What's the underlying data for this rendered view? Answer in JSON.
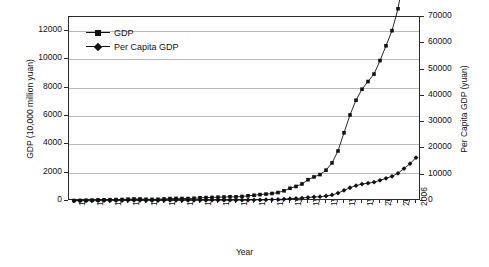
{
  "chart_data": {
    "type": "line",
    "title": "",
    "xlabel": "Year",
    "ylabel": "GDP (10,000 million yuan)",
    "y2label": "Per Capita GDP (yuan)",
    "ylim": [
      0,
      13000
    ],
    "y2lim": [
      0,
      70000
    ],
    "yticks": [
      0,
      2000,
      4000,
      6000,
      8000,
      10000,
      12000
    ],
    "y2ticks": [
      0,
      10000,
      20000,
      30000,
      40000,
      50000,
      60000,
      70000
    ],
    "grid": true,
    "legend_position": "top-left inside plot",
    "xlim": [
      1949,
      2006
    ],
    "xticks": [
      1949,
      1952,
      1955,
      1958,
      1961,
      1964,
      1967,
      1970,
      1973,
      1976,
      1979,
      1982,
      1985,
      1988,
      1991,
      1994,
      1997,
      2000,
      2003,
      2006
    ],
    "x": [
      1949,
      1950,
      1951,
      1952,
      1953,
      1954,
      1955,
      1956,
      1957,
      1958,
      1959,
      1960,
      1961,
      1962,
      1963,
      1964,
      1965,
      1966,
      1967,
      1968,
      1969,
      1970,
      1971,
      1972,
      1973,
      1974,
      1975,
      1976,
      1977,
      1978,
      1979,
      1980,
      1981,
      1982,
      1983,
      1984,
      1985,
      1986,
      1987,
      1988,
      1989,
      1990,
      1991,
      1992,
      1993,
      1994,
      1995,
      1996,
      1997,
      1998,
      1999,
      2000,
      2001,
      2002,
      2003,
      2004,
      2005,
      2006
    ],
    "series": [
      {
        "name": "GDP",
        "marker": "square",
        "axis": "left",
        "units": "10,000 million yuan",
        "values": [
          30,
          40,
          50,
          60,
          80,
          85,
          91,
          103,
          107,
          131,
          144,
          146,
          122,
          114,
          123,
          145,
          172,
          187,
          177,
          172,
          194,
          225,
          242,
          252,
          272,
          279,
          299,
          294,
          321,
          365,
          406,
          452,
          489,
          532,
          596,
          720,
          901,
          1028,
          1205,
          1504,
          1700,
          1866,
          2178,
          2692,
          3533,
          4820,
          6079,
          7118,
          7897,
          8440,
          8968,
          9921,
          10966,
          12033,
          13582,
          15988,
          18494,
          21631
        ]
      },
      {
        "name": "Per Capita GDP",
        "marker": "diamond",
        "axis": "right",
        "units": "yuan",
        "values": [
          70,
          80,
          90,
          120,
          140,
          145,
          150,
          165,
          170,
          200,
          220,
          215,
          175,
          160,
          175,
          205,
          240,
          255,
          235,
          225,
          250,
          275,
          290,
          295,
          310,
          315,
          330,
          320,
          340,
          385,
          420,
          465,
          495,
          535,
          585,
          695,
          860,
          965,
          1112,
          1366,
          1519,
          1644,
          1893,
          2311,
          2998,
          4044,
          5046,
          5846,
          6420,
          6796,
          7159,
          7858,
          8622,
          9398,
          10542,
          12336,
          14185,
          16500
        ]
      }
    ],
    "notes": {
      "gdp_final_left_axis": 12500,
      "percapita_final_right_axis": 66000
    }
  },
  "axes": {
    "y_left": {
      "title": "GDP (10,000 million yuan)",
      "ticks": [
        "0",
        "2000",
        "4000",
        "6000",
        "8000",
        "10000",
        "12000"
      ]
    },
    "y_right": {
      "title": "Per Capita GDP (yuan)",
      "ticks": [
        "0",
        "10000",
        "20000",
        "30000",
        "40000",
        "50000",
        "60000",
        "70000"
      ]
    },
    "x": {
      "title": "Year",
      "ticks": [
        "1949",
        "1952",
        "1955",
        "1958",
        "1961",
        "1964",
        "1967",
        "1970",
        "1973",
        "1976",
        "1979",
        "1982",
        "1985",
        "1988",
        "1991",
        "1994",
        "1997",
        "2000",
        "2003",
        "2006"
      ]
    }
  },
  "legend": {
    "entries": [
      {
        "label": "GDP",
        "marker": "square-marker",
        "color": "#111111"
      },
      {
        "label": "Per Capita GDP",
        "marker": "diamond-marker",
        "color": "#111111"
      }
    ]
  },
  "colors": {
    "series": "#111111",
    "grid": "#b9b9b9",
    "frame": "#2b2b2b",
    "background": "#ffffff"
  }
}
